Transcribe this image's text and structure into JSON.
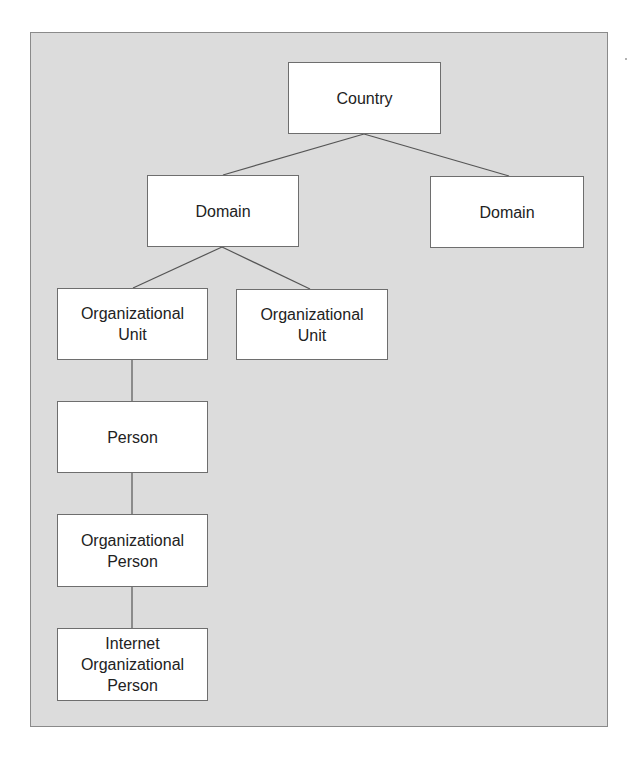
{
  "diagram": {
    "type": "hierarchy-tree",
    "colors": {
      "background": "#dcdcdc",
      "node_fill": "#ffffff",
      "node_border": "#6e6e6e",
      "connector": "#555555",
      "text": "#222222"
    },
    "nodes": {
      "country": {
        "label": "Country"
      },
      "domain_left": {
        "label": "Domain"
      },
      "domain_right": {
        "label": "Domain"
      },
      "ou_left": {
        "label": "Organizational\nUnit"
      },
      "ou_right": {
        "label": "Organizational\nUnit"
      },
      "person": {
        "label": "Person"
      },
      "org_person": {
        "label": "Organizational\nPerson"
      },
      "inet_org_person": {
        "label": "Internet\nOrganizational\nPerson"
      }
    },
    "edges": [
      {
        "from": "country",
        "to": "domain_left"
      },
      {
        "from": "country",
        "to": "domain_right"
      },
      {
        "from": "domain_left",
        "to": "ou_left"
      },
      {
        "from": "domain_left",
        "to": "ou_right"
      },
      {
        "from": "ou_left",
        "to": "person"
      },
      {
        "from": "person",
        "to": "org_person"
      },
      {
        "from": "org_person",
        "to": "inet_org_person"
      }
    ]
  }
}
